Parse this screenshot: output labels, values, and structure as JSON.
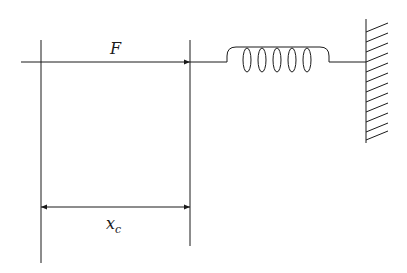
{
  "diagram": {
    "type": "spring-force-schematic",
    "labels": {
      "force": "F",
      "displacement_main": "x",
      "displacement_sub": "c"
    },
    "colors": {
      "line": "#1a1a1a",
      "background": "#ffffff"
    },
    "components": {
      "force_arrow": {
        "direction": "right"
      },
      "spring": {
        "coils": 6
      },
      "wall": {
        "hatch_count": 13
      },
      "dimension_arrow": {
        "style": "double-headed"
      }
    }
  }
}
